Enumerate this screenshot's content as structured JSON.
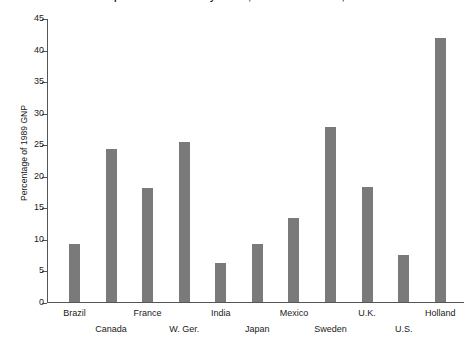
{
  "chart_data": {
    "type": "bar",
    "title": "Expenditures on Military Goods, Selected Countries, 1989",
    "xlabel": "",
    "ylabel": "Percentage of 1989 GNP",
    "ylim": [
      0,
      45
    ],
    "ytick_step": 5,
    "yticks": [
      "45",
      "40",
      "35",
      "30",
      "25",
      "20",
      "15",
      "10",
      "5",
      "0"
    ],
    "grid": false,
    "legend": "none",
    "bar_color": "#7a7a7a",
    "axis_color": "#555555",
    "categories": [
      "Brazil",
      "Canada",
      "France",
      "W. Ger.",
      "India",
      "Japan",
      "Mexico",
      "Sweden",
      "U.K.",
      "U.S.",
      "Holland"
    ],
    "values": [
      9.2,
      24.3,
      18.1,
      25.4,
      6.2,
      9.2,
      13.3,
      27.7,
      18.3,
      7.4,
      41.9
    ],
    "label_rows": [
      0,
      1,
      0,
      1,
      0,
      1,
      0,
      1,
      0,
      1,
      0
    ]
  }
}
